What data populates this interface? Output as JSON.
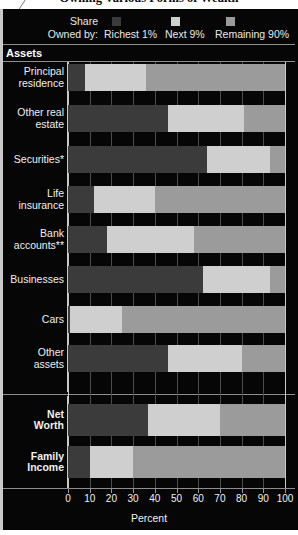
{
  "title": "Owning Various Forms of Wealth",
  "legend": {
    "caption_line1": "Share",
    "caption_line2": "Owned by:",
    "items": [
      {
        "label": "Richest 1%",
        "color": "#3b3b3b"
      },
      {
        "label": "Next 9%",
        "color": "#cfcfcf"
      },
      {
        "label": "Remaining 90%",
        "color": "#9b9b9b"
      }
    ]
  },
  "sections": {
    "assets_header": "Assets"
  },
  "axis": {
    "title": "Percent",
    "ticks": [
      0,
      10,
      20,
      30,
      40,
      50,
      60,
      70,
      80,
      90,
      100
    ],
    "min": 0,
    "max": 100
  },
  "chart_data": {
    "type": "bar",
    "orientation": "horizontal",
    "stacked": true,
    "normalized_to": 100,
    "title": "Owning Various Forms of Wealth",
    "xlabel": "Percent",
    "ylabel": "",
    "xlim": [
      0,
      100
    ],
    "grid": true,
    "legend_position": "top",
    "series": [
      {
        "name": "Richest 1%",
        "color": "#3b3b3b",
        "values": [
          8,
          46,
          64,
          12,
          18,
          62,
          1,
          46,
          37,
          10
        ]
      },
      {
        "name": "Next 9%",
        "color": "#cfcfcf",
        "values": [
          28,
          35,
          29,
          28,
          40,
          31,
          24,
          34,
          33,
          20
        ]
      },
      {
        "name": "Remaining 90%",
        "color": "#9b9b9b",
        "values": [
          64,
          19,
          7,
          60,
          42,
          7,
          75,
          20,
          30,
          70
        ]
      }
    ],
    "categories": [
      "Principal residence",
      "Other real estate",
      "Securities*",
      "Life insurance",
      "Bank accounts**",
      "Businesses",
      "Cars",
      "Other assets",
      "Net Worth",
      "Family Income"
    ]
  },
  "rows": [
    {
      "label_line1": "Principal",
      "label_line2": "residence",
      "bold": false,
      "segments": [
        8,
        28,
        64
      ]
    },
    {
      "label_line1": "Other real",
      "label_line2": "estate",
      "bold": false,
      "segments": [
        46,
        35,
        19
      ]
    },
    {
      "label_line1": "Securities*",
      "label_line2": "",
      "bold": false,
      "segments": [
        64,
        29,
        7
      ]
    },
    {
      "label_line1": "Life",
      "label_line2": "insurance",
      "bold": false,
      "segments": [
        12,
        28,
        60
      ]
    },
    {
      "label_line1": "Bank",
      "label_line2": "accounts**",
      "bold": false,
      "segments": [
        18,
        40,
        42
      ]
    },
    {
      "label_line1": "Businesses",
      "label_line2": "",
      "bold": false,
      "segments": [
        62,
        31,
        7
      ]
    },
    {
      "label_line1": "Cars",
      "label_line2": "",
      "bold": false,
      "segments": [
        1,
        24,
        75
      ]
    },
    {
      "label_line1": "Other",
      "label_line2": "assets",
      "bold": false,
      "segments": [
        46,
        34,
        20
      ]
    },
    {
      "label_line1": "Net",
      "label_line2": "Worth",
      "bold": true,
      "segments": [
        37,
        33,
        30
      ]
    },
    {
      "label_line1": "Family",
      "label_line2": "Income",
      "bold": true,
      "segments": [
        10,
        20,
        70
      ]
    }
  ]
}
